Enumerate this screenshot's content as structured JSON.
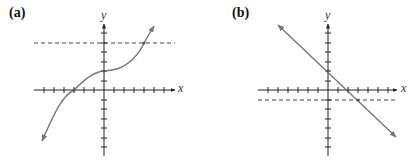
{
  "panels": [
    {
      "label": "(a)",
      "x_axis_label": "x",
      "y_axis_label": "y",
      "curve": "increasing cubic-like curve with arrowheads at both ends",
      "horizontal_dashed_line_y": 5,
      "curve_points": {
        "x_intercept": -3,
        "y_intercept": 2,
        "intersection_with_dashed": [
          4,
          5
        ]
      },
      "colors": {
        "curve": "#777777",
        "axes": "#222222",
        "dashed": "#444444"
      }
    },
    {
      "label": "(b)",
      "x_axis_label": "x",
      "y_axis_label": "y",
      "curve": "decreasing straight line with arrowheads at both ends",
      "horizontal_dashed_line_y": -1,
      "curve_points": {
        "x_intercept": 2,
        "y_intercept": 2,
        "intersection_with_dashed": [
          3,
          -1
        ]
      },
      "colors": {
        "curve": "#777777",
        "axes": "#222222",
        "dashed": "#444444"
      }
    }
  ]
}
